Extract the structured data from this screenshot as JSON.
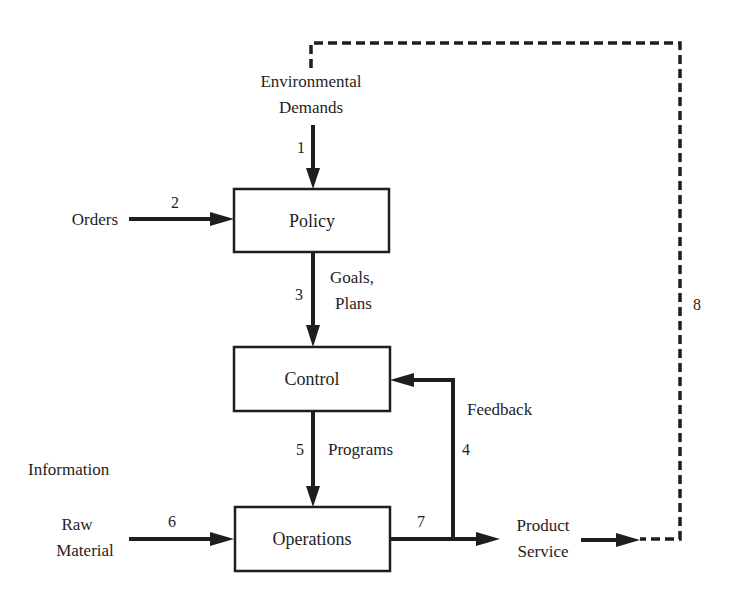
{
  "caption": "",
  "boxes": {
    "policy": {
      "label": "Policy"
    },
    "control": {
      "label": "Control"
    },
    "operations": {
      "label": "Operations"
    }
  },
  "inputs": {
    "environmental_demands": {
      "line1": "Environmental",
      "line2": "Demands"
    },
    "orders": {
      "label": "Orders"
    },
    "information": {
      "label": "Information"
    },
    "raw_material": {
      "line1": "Raw",
      "line2": "Material"
    }
  },
  "outputs": {
    "product_service": {
      "line1": "Product",
      "line2": "Service"
    }
  },
  "flow_labels": {
    "goals_plans": {
      "line1": "Goals,",
      "line2": "Plans"
    },
    "programs": {
      "label": "Programs"
    },
    "feedback": {
      "label": "Feedback"
    }
  },
  "flow_numbers": {
    "n1": "1",
    "n2": "2",
    "n3": "3",
    "n4": "4",
    "n5": "5",
    "n6": "6",
    "n7": "7",
    "n8": "8"
  },
  "colors": {
    "ink": "#1e1e1e",
    "background": "#ffffff"
  }
}
